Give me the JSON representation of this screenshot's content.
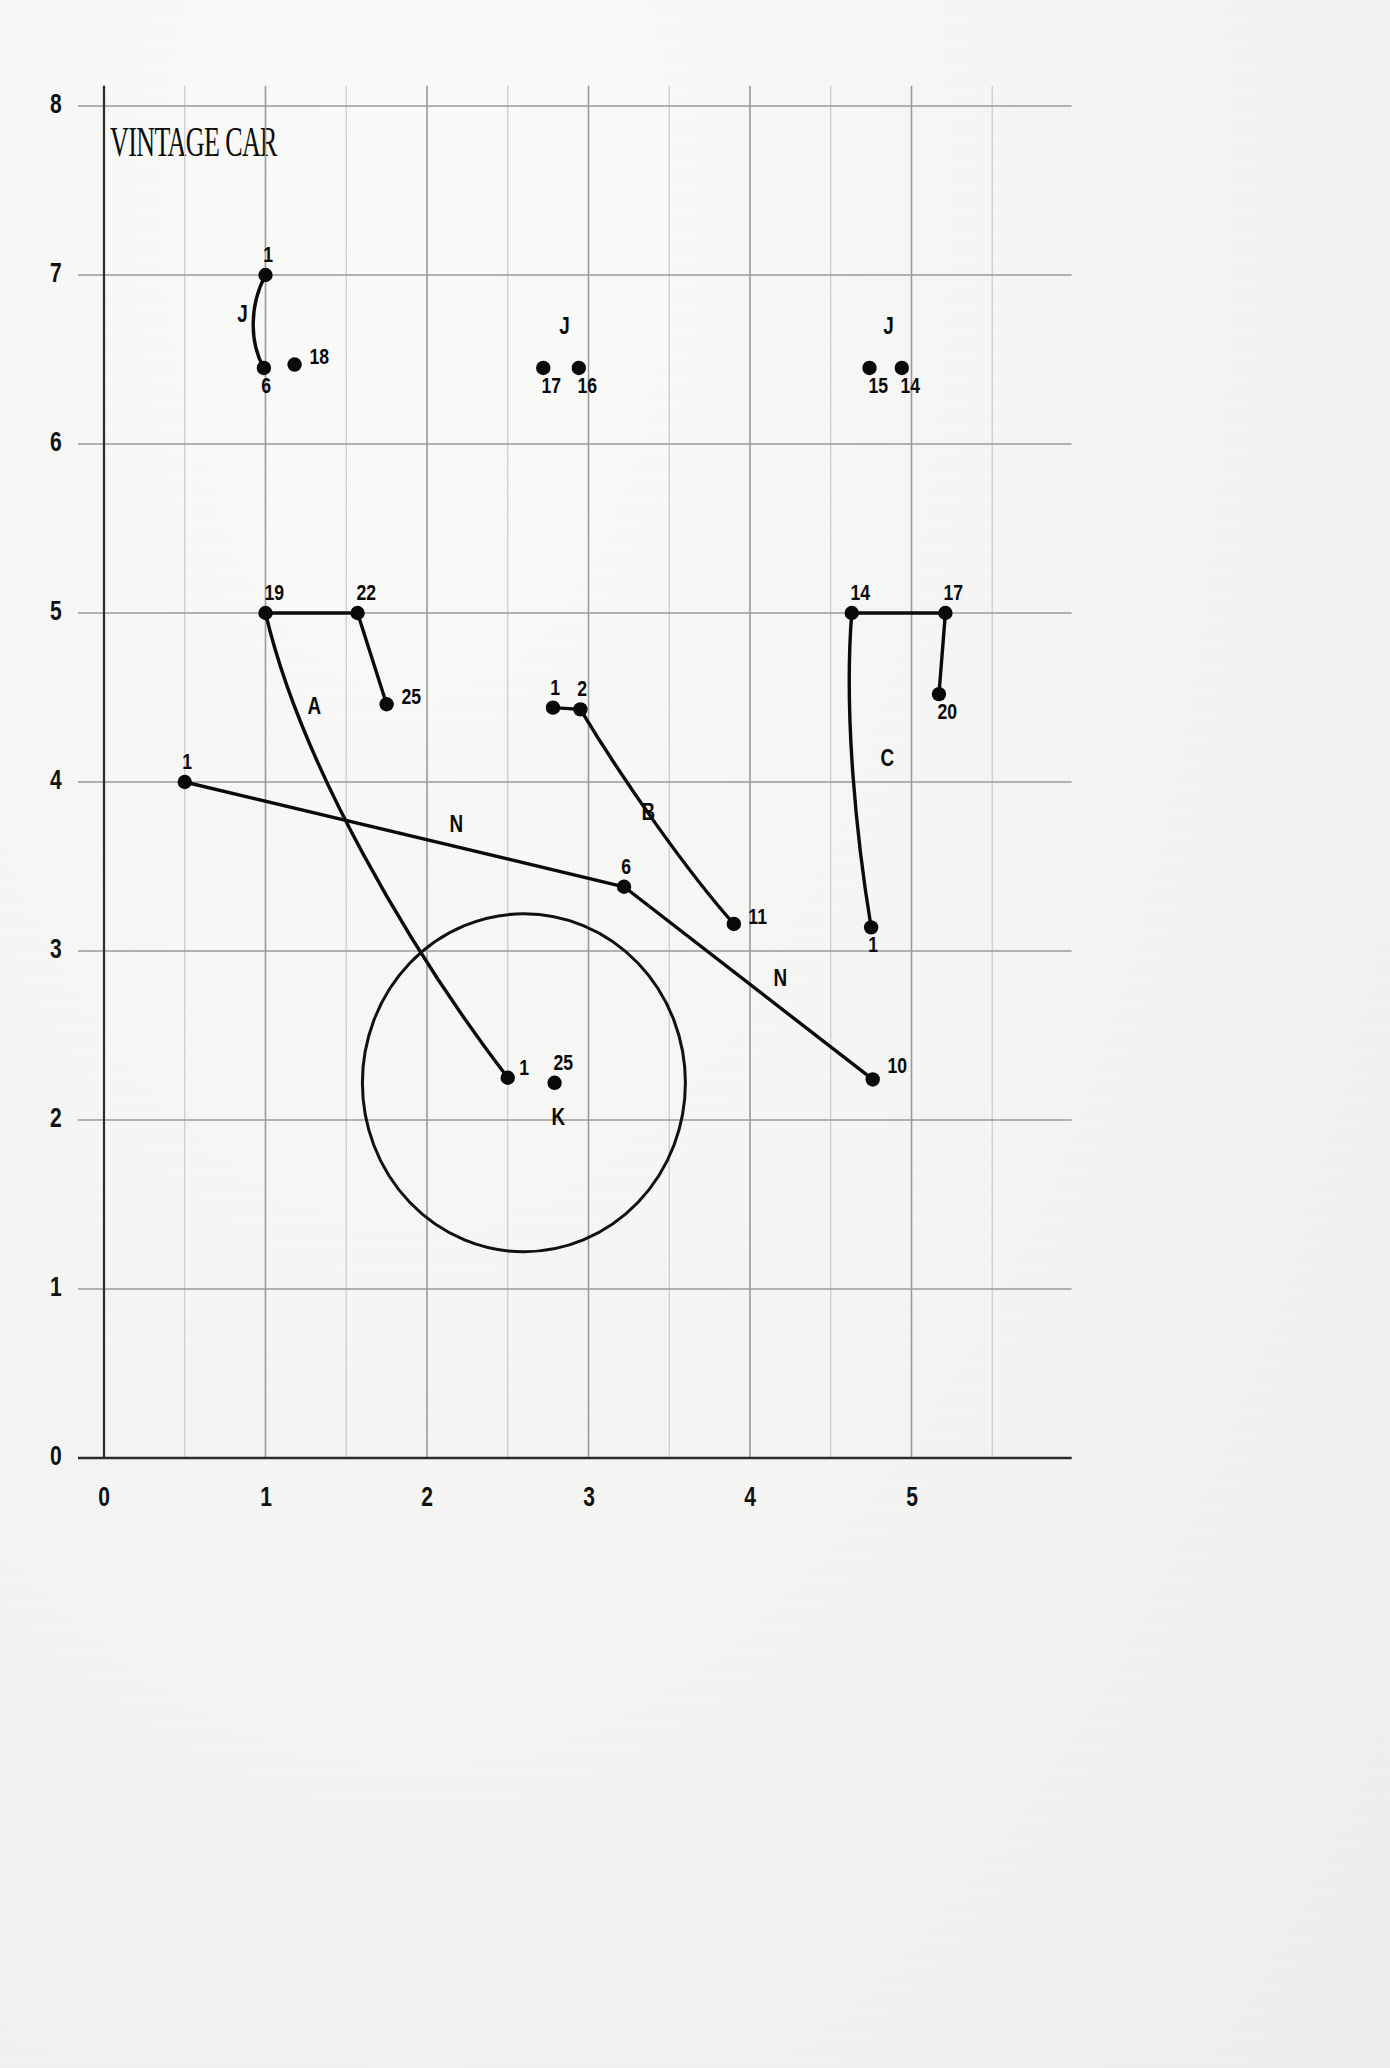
{
  "title": "VINTAGE CAR",
  "chart_data": {
    "type": "scatter",
    "title": "VINTAGE CAR",
    "xlabel": "",
    "ylabel": "",
    "xlim": [
      0,
      5.6
    ],
    "ylim": [
      0,
      8.1
    ],
    "grid": true,
    "legend": "none",
    "xticks": [
      "0",
      "1",
      "2",
      "3",
      "4",
      "5"
    ],
    "xtick_values": [
      0,
      1,
      2,
      3,
      4,
      5
    ],
    "yticks": [
      "0",
      "1",
      "2",
      "3",
      "4",
      "5",
      "6",
      "7",
      "8"
    ],
    "ytick_values": [
      0,
      1,
      2,
      3,
      4,
      5,
      6,
      7,
      8
    ],
    "points": [
      {
        "id": "p1",
        "label": "1",
        "x": 1.0,
        "y": 7.0,
        "label_dx": -4,
        "label_dy": -22
      },
      {
        "id": "p2",
        "label": "6",
        "x": 0.99,
        "y": 6.45,
        "label_dx": -4,
        "label_dy": 16
      },
      {
        "id": "p3",
        "label": "18",
        "x": 1.18,
        "y": 6.47,
        "label_dx": 12,
        "label_dy": -10
      },
      {
        "id": "p4",
        "label": "17",
        "x": 2.72,
        "y": 6.45,
        "label_dx": -4,
        "label_dy": 16
      },
      {
        "id": "p5",
        "label": "16",
        "x": 2.94,
        "y": 6.45,
        "label_dx": -4,
        "label_dy": 16
      },
      {
        "id": "p6",
        "label": "15",
        "x": 4.74,
        "y": 6.45,
        "label_dx": -4,
        "label_dy": 16
      },
      {
        "id": "p7",
        "label": "14",
        "x": 4.94,
        "y": 6.45,
        "label_dx": -4,
        "label_dy": 16
      },
      {
        "id": "p8",
        "label": "19",
        "x": 1.0,
        "y": 5.0,
        "label_dx": -4,
        "label_dy": -22
      },
      {
        "id": "p9",
        "label": "22",
        "x": 1.57,
        "y": 5.0,
        "label_dx": -4,
        "label_dy": -22
      },
      {
        "id": "p10",
        "label": "25",
        "x": 1.75,
        "y": 4.46,
        "label_dx": 12,
        "label_dy": -9
      },
      {
        "id": "p11",
        "label": "14",
        "x": 4.63,
        "y": 5.0,
        "label_dx": -4,
        "label_dy": -22
      },
      {
        "id": "p12",
        "label": "17",
        "x": 5.21,
        "y": 5.0,
        "label_dx": -4,
        "label_dy": -22
      },
      {
        "id": "p13",
        "label": "20",
        "x": 5.17,
        "y": 4.52,
        "label_dx": -4,
        "label_dy": 16
      },
      {
        "id": "p14",
        "label": "1",
        "x": 2.78,
        "y": 4.44,
        "label_dx": -4,
        "label_dy": -22
      },
      {
        "id": "p15",
        "label": "2",
        "x": 2.95,
        "y": 4.43,
        "label_dx": -4,
        "label_dy": -22
      },
      {
        "id": "p16",
        "label": "1",
        "x": 0.5,
        "y": 4.0,
        "label_dx": -4,
        "label_dy": -22
      },
      {
        "id": "p17",
        "label": "6",
        "x": 3.22,
        "y": 3.38,
        "label_dx": -4,
        "label_dy": -22
      },
      {
        "id": "p18",
        "label": "11",
        "x": 3.9,
        "y": 3.16,
        "label_dx": 12,
        "label_dy": -9
      },
      {
        "id": "p19",
        "label": "1",
        "x": 4.75,
        "y": 3.14,
        "label_dx": -4,
        "label_dy": 16
      },
      {
        "id": "p20",
        "label": "10",
        "x": 4.76,
        "y": 2.24,
        "label_dx": 12,
        "label_dy": -15
      },
      {
        "id": "p21",
        "label": "1",
        "x": 2.5,
        "y": 2.25,
        "label_dx": 10,
        "label_dy": -12
      },
      {
        "id": "p22",
        "label": "25",
        "x": 2.79,
        "y": 2.22,
        "label_dx": -4,
        "label_dy": -22
      }
    ],
    "curve_labels": [
      {
        "id": "c1",
        "label": "J",
        "x": 0.85,
        "y": 6.77
      },
      {
        "id": "c2",
        "label": "J",
        "x": 2.84,
        "y": 6.7
      },
      {
        "id": "c3",
        "label": "J",
        "x": 4.85,
        "y": 6.7
      },
      {
        "id": "c4",
        "label": "A",
        "x": 1.28,
        "y": 4.45
      },
      {
        "id": "c5",
        "label": "B",
        "x": 3.35,
        "y": 3.82
      },
      {
        "id": "c6",
        "label": "C",
        "x": 4.83,
        "y": 4.14
      },
      {
        "id": "c7",
        "label": "N",
        "x": 2.16,
        "y": 3.75
      },
      {
        "id": "c8",
        "label": "N",
        "x": 4.17,
        "y": 2.84
      },
      {
        "id": "c9",
        "label": "K",
        "x": 2.79,
        "y": 2.02
      }
    ],
    "circle": {
      "cx": 2.6,
      "cy": 2.22,
      "r": 1.0
    },
    "paths": [
      {
        "id": "curve-J",
        "label": "J",
        "d": "M 1.00 7.00 C 0.90 6.82 0.90 6.60 0.99 6.45"
      },
      {
        "id": "curve-A",
        "label": "A",
        "d": "M 1.00 5.00 C 1.22 4.10 1.90 3.00 2.50 2.25"
      },
      {
        "id": "curve-B",
        "label": "B",
        "d": "M 2.95 4.43 C 3.22 4.00 3.62 3.46 3.90 3.16"
      },
      {
        "id": "curve-C",
        "label": "C",
        "d": "M 4.63 5.00 C 4.58 4.40 4.66 3.66 4.75 3.14"
      },
      {
        "id": "seg-19-22",
        "label": "",
        "d": "M 1.00 5.00 L 1.57 5.00"
      },
      {
        "id": "seg-22-25",
        "label": "",
        "d": "M 1.57 5.00 L 1.75 4.46"
      },
      {
        "id": "seg-14-17",
        "label": "",
        "d": "M 4.63 5.00 L 5.21 5.00"
      },
      {
        "id": "seg-17-20",
        "label": "",
        "d": "M 5.21 5.00 L 5.17 4.52"
      },
      {
        "id": "seg-1-2",
        "label": "",
        "d": "M 2.78 4.44 L 2.95 4.43"
      },
      {
        "id": "seg-N1",
        "label": "N",
        "d": "M 0.50 4.00 L 3.22 3.38"
      },
      {
        "id": "seg-N2",
        "label": "N",
        "d": "M 3.22 3.38 L 4.76 2.24"
      }
    ]
  }
}
